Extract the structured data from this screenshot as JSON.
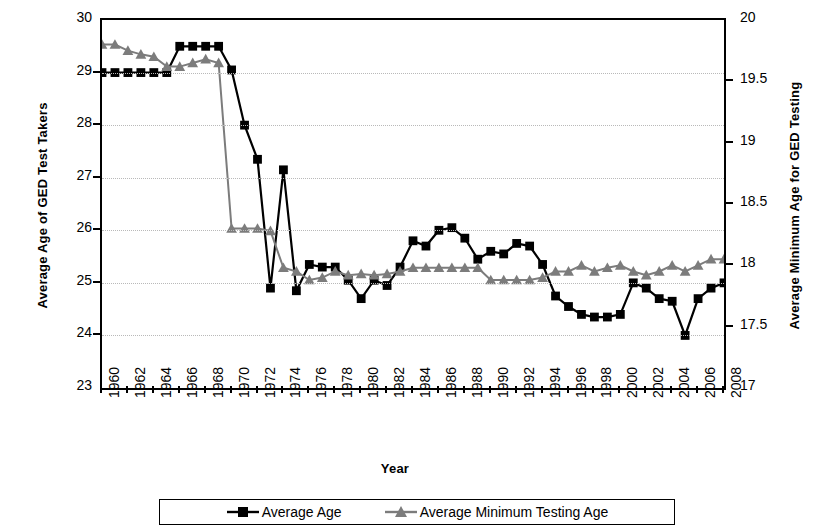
{
  "chart_data": {
    "type": "line",
    "title": "",
    "xlabel": "Year",
    "ylabel": "Average  Age of GED Test Takers",
    "ylabel_right": "Average Minimum Age for GED Testing",
    "ylim": [
      23,
      30
    ],
    "ylim_right": [
      17,
      20
    ],
    "yticks": [
      23,
      24,
      25,
      26,
      27,
      28,
      29,
      30
    ],
    "yticks_right": [
      17,
      17.5,
      18,
      18.5,
      19,
      19.5,
      20
    ],
    "grid": true,
    "legend_position": "bottom",
    "x": [
      1960,
      1961,
      1962,
      1963,
      1964,
      1965,
      1966,
      1967,
      1968,
      1969,
      1970,
      1971,
      1972,
      1973,
      1974,
      1975,
      1976,
      1977,
      1978,
      1979,
      1980,
      1981,
      1982,
      1983,
      1984,
      1985,
      1986,
      1987,
      1988,
      1989,
      1990,
      1991,
      1992,
      1993,
      1994,
      1995,
      1996,
      1997,
      1998,
      1999,
      2000,
      2001,
      2002,
      2003,
      2004,
      2005,
      2006,
      2007,
      2008
    ],
    "xticks": [
      1960,
      1962,
      1964,
      1966,
      1968,
      1970,
      1972,
      1974,
      1976,
      1978,
      1980,
      1982,
      1984,
      1986,
      1988,
      1990,
      1992,
      1994,
      1996,
      1998,
      2000,
      2002,
      2004,
      2006,
      2008
    ],
    "series": [
      {
        "name": "Average Age",
        "axis": "left",
        "color": "#000000",
        "marker": "square",
        "values": [
          29.0,
          29.0,
          29.0,
          29.0,
          29.0,
          29.0,
          29.5,
          29.5,
          29.5,
          29.5,
          29.05,
          28.0,
          27.35,
          24.9,
          27.15,
          24.85,
          25.35,
          25.3,
          25.3,
          25.05,
          24.7,
          25.05,
          24.95,
          25.3,
          25.8,
          25.7,
          26.0,
          26.05,
          25.85,
          25.45,
          25.6,
          25.55,
          25.75,
          25.7,
          25.35,
          24.75,
          24.55,
          24.4,
          24.35,
          24.35,
          24.4,
          25.0,
          24.9,
          24.7,
          24.65,
          24.0,
          24.7,
          24.9,
          25.0
        ]
      },
      {
        "name": "Average Minimum Testing Age",
        "axis": "right",
        "color": "#7c7c7c",
        "marker": "triangle",
        "values": [
          19.8,
          19.8,
          19.75,
          19.72,
          19.7,
          19.62,
          19.62,
          19.65,
          19.68,
          19.65,
          18.3,
          18.3,
          18.3,
          18.28,
          17.98,
          17.95,
          17.88,
          17.9,
          17.95,
          17.92,
          17.93,
          17.92,
          17.93,
          17.95,
          17.98,
          17.98,
          17.98,
          17.98,
          17.98,
          17.98,
          17.88,
          17.88,
          17.88,
          17.88,
          17.9,
          17.95,
          17.95,
          18.0,
          17.95,
          17.98,
          18.0,
          17.95,
          17.92,
          17.95,
          18.0,
          17.95,
          18.0,
          18.05,
          18.05
        ]
      }
    ]
  },
  "legend": {
    "items": [
      {
        "label": "Average Age",
        "marker": "square",
        "color": "#000000"
      },
      {
        "label": "Average Minimum Testing Age",
        "marker": "triangle",
        "color": "#7c7c7c"
      }
    ]
  }
}
